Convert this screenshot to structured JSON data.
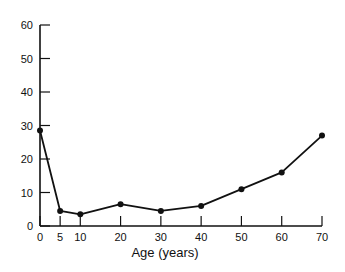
{
  "chart_data": {
    "type": "line",
    "title": "",
    "xlabel": "Age (years)",
    "ylabel": "",
    "x": [
      0,
      5,
      10,
      20,
      30,
      40,
      50,
      60,
      70
    ],
    "series": [
      {
        "name": "",
        "values": [
          28.5,
          4.5,
          3.5,
          6.5,
          4.5,
          6,
          11,
          16,
          27
        ]
      }
    ],
    "x_ticks": [
      0,
      5,
      10,
      20,
      30,
      40,
      50,
      60,
      70
    ],
    "y_ticks": [
      0,
      10,
      20,
      30,
      40,
      50,
      60
    ],
    "xlim": [
      0,
      70
    ],
    "ylim": [
      0,
      60
    ],
    "grid": false,
    "legend": "none",
    "markers": true,
    "color": "#111111"
  }
}
